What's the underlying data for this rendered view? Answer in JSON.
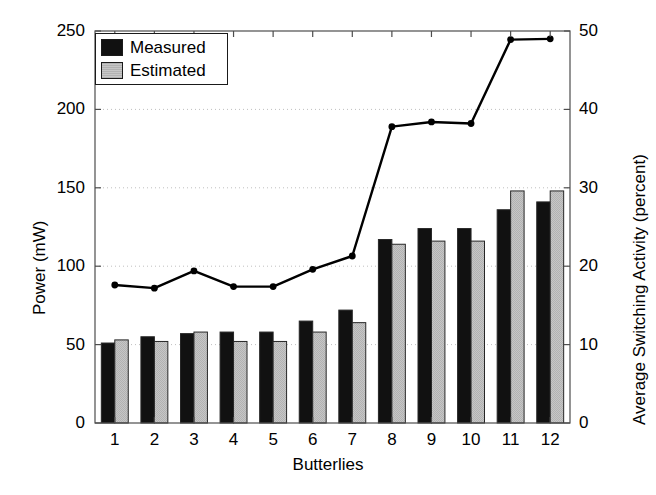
{
  "chart_data": {
    "type": "bar",
    "title": "",
    "xlabel": "Butterlies",
    "ylabel": "Power (mW)",
    "y2label": "Average Switching Activity (percent)",
    "categories": [
      "1",
      "2",
      "3",
      "4",
      "5",
      "6",
      "7",
      "8",
      "9",
      "10",
      "11",
      "12"
    ],
    "ylim": [
      0,
      250
    ],
    "yticks": [
      0,
      50,
      100,
      150,
      200,
      250
    ],
    "ytick_labels": [
      "0",
      "50",
      "100",
      "150",
      "200",
      "250"
    ],
    "y2lim": [
      0,
      50
    ],
    "y2ticks": [
      0,
      10,
      20,
      30,
      40,
      50
    ],
    "y2tick_labels": [
      "0",
      "10",
      "20",
      "30",
      "40",
      "50"
    ],
    "grid": true,
    "legend_position": "upper-left",
    "series": [
      {
        "name": "Measured",
        "kind": "bar",
        "color": "#111111",
        "axis": "left",
        "values": [
          51,
          55,
          57,
          58,
          58,
          65,
          72,
          117,
          124,
          124,
          136,
          141
        ]
      },
      {
        "name": "Estimated",
        "kind": "bar",
        "color": "#c0c0c0",
        "axis": "left",
        "values": [
          53,
          52,
          58,
          52,
          52,
          58,
          64,
          114,
          116,
          116,
          148,
          148
        ]
      },
      {
        "name": "Average Switching Activity",
        "kind": "line",
        "color": "#000000",
        "axis": "right",
        "values": [
          17.6,
          17.2,
          19.4,
          17.4,
          17.4,
          19.6,
          21.3,
          37.8,
          38.4,
          38.2,
          48.9,
          49.0
        ]
      }
    ]
  },
  "legend": {
    "items": [
      {
        "label": "Measured",
        "color": "#111111"
      },
      {
        "label": "Estimated",
        "color": "#c0c0c0"
      }
    ]
  }
}
